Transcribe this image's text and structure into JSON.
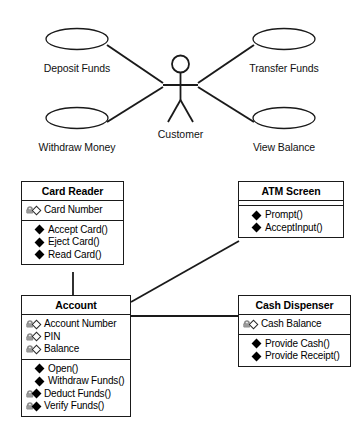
{
  "diagram": {
    "background_color": "#ffffff",
    "line_color": "#1a1a1a",
    "lock_icon_color": "#8c8c8c"
  },
  "use_case_section": {
    "actor": {
      "name": "customer-actor",
      "label": "Customer",
      "icon": "stick-figure-actor-icon"
    },
    "use_cases": [
      {
        "id": "deposit-funds",
        "label": "Deposit Funds",
        "icon": "ellipse-use-case-icon"
      },
      {
        "id": "transfer-funds",
        "label": "Transfer Funds",
        "icon": "ellipse-use-case-icon"
      },
      {
        "id": "withdraw-money",
        "label": "Withdraw Money",
        "icon": "ellipse-use-case-icon"
      },
      {
        "id": "view-balance",
        "label": "View Balance",
        "icon": "ellipse-use-case-icon"
      }
    ],
    "associations": [
      {
        "from": "customer-actor",
        "to": "deposit-funds"
      },
      {
        "from": "customer-actor",
        "to": "transfer-funds"
      },
      {
        "from": "customer-actor",
        "to": "withdraw-money"
      },
      {
        "from": "customer-actor",
        "to": "view-balance"
      }
    ]
  },
  "class_section": {
    "classes": [
      {
        "id": "card-reader",
        "title": "Card Reader",
        "attributes": [
          {
            "label": "Card Number",
            "icon": "lock-hollow-diamond-icon"
          }
        ],
        "operations": [
          {
            "label": "Accept Card()",
            "icon": "filled-diamond-icon"
          },
          {
            "label": "Eject Card()",
            "icon": "filled-diamond-icon"
          },
          {
            "label": "Read Card()",
            "icon": "filled-diamond-icon"
          }
        ]
      },
      {
        "id": "atm-screen",
        "title": "ATM Screen",
        "attributes": [],
        "operations": [
          {
            "label": "Prompt()",
            "icon": "filled-diamond-icon"
          },
          {
            "label": "AcceptInput()",
            "icon": "filled-diamond-icon"
          }
        ]
      },
      {
        "id": "account",
        "title": "Account",
        "attributes": [
          {
            "label": "Account Number",
            "icon": "lock-hollow-diamond-icon"
          },
          {
            "label": "PIN",
            "icon": "lock-hollow-diamond-icon"
          },
          {
            "label": "Balance",
            "icon": "lock-hollow-diamond-icon"
          }
        ],
        "operations": [
          {
            "label": "Open()",
            "icon": "filled-diamond-icon"
          },
          {
            "label": "Withdraw Funds()",
            "icon": "filled-diamond-icon"
          },
          {
            "label": "Deduct Funds()",
            "icon": "lock-filled-diamond-icon"
          },
          {
            "label": "Verify Funds()",
            "icon": "lock-filled-diamond-icon"
          }
        ]
      },
      {
        "id": "cash-dispenser",
        "title": "Cash Dispenser",
        "attributes": [
          {
            "label": "Cash Balance",
            "icon": "lock-hollow-diamond-icon"
          }
        ],
        "operations": [
          {
            "label": "Provide Cash()",
            "icon": "filled-diamond-icon"
          },
          {
            "label": "Provide Receipt()",
            "icon": "filled-diamond-icon"
          }
        ]
      }
    ],
    "associations": [
      {
        "from": "card-reader",
        "to": "account"
      },
      {
        "from": "account",
        "to": "atm-screen"
      },
      {
        "from": "account",
        "to": "cash-dispenser"
      }
    ]
  }
}
